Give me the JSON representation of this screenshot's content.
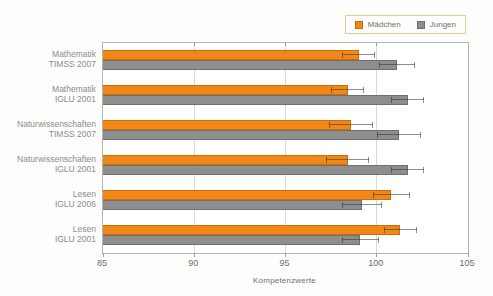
{
  "chart_data": {
    "type": "bar",
    "orientation": "horizontal",
    "title": "",
    "xlabel": "Kompetenzwerte",
    "xlim": [
      85,
      105
    ],
    "xticks": [
      85,
      90,
      95,
      100,
      105
    ],
    "grid": true,
    "legend_position": "top-right",
    "categories": [
      [
        "Mathematik",
        "TIMSS 2007"
      ],
      [
        "Mathematik",
        "IGLU 2001"
      ],
      [
        "Naturwissenschaften",
        "TIMSS 2007"
      ],
      [
        "Naturwissenschaften",
        "IGLU 2001"
      ],
      [
        "Lesen",
        "IGLU 2006"
      ],
      [
        "Lesen",
        "IGLU 2001"
      ]
    ],
    "series": [
      {
        "name": "Mädchen",
        "color": "#F28718",
        "border_color": "#C86F05",
        "values": [
          99.0,
          98.4,
          98.6,
          98.4,
          100.8,
          101.3
        ],
        "errors": [
          0.9,
          0.9,
          1.2,
          1.2,
          1.0,
          0.9
        ]
      },
      {
        "name": "Jungen",
        "color": "#8E8E8E",
        "border_color": "#6F6F6F",
        "values": [
          101.1,
          101.7,
          101.2,
          101.7,
          99.2,
          99.1
        ],
        "errors": [
          1.0,
          0.9,
          1.2,
          0.9,
          1.1,
          1.0
        ]
      }
    ],
    "error_bar_color": "rgba(50,50,50,0.55)",
    "frame_color": "#b4b4b4",
    "gridline_color": "#d8d8d6"
  }
}
